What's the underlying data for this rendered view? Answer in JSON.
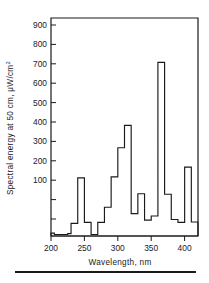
{
  "chart_data": {
    "type": "line",
    "title": "",
    "subtitle": "",
    "xlabel": "Wavelength, nm",
    "ylabel": "Spectral energy at 50 cm, μW/cm²",
    "xlim": [
      200,
      420
    ],
    "ylim": [
      0,
      950
    ],
    "xticks": [
      200,
      250,
      300,
      350,
      400
    ],
    "yticks": [
      100,
      200,
      300,
      400,
      500,
      600,
      700,
      800,
      900
    ],
    "grid": false,
    "legend": null,
    "style": "step",
    "x_bin_edges": [
      200,
      205,
      210,
      215,
      220,
      225,
      230,
      235,
      240,
      245,
      250,
      255,
      260,
      265,
      270,
      275,
      280,
      285,
      290,
      295,
      300,
      305,
      310,
      315,
      320,
      325,
      330,
      335,
      340,
      345,
      350,
      355,
      360,
      365,
      370,
      375,
      380,
      385,
      390,
      395,
      400,
      405,
      410,
      415,
      420
    ],
    "values": [
      15,
      8,
      8,
      8,
      8,
      12,
      65,
      65,
      300,
      300,
      70,
      70,
      8,
      8,
      70,
      70,
      148,
      148,
      305,
      305,
      455,
      455,
      570,
      570,
      115,
      115,
      218,
      218,
      82,
      82,
      103,
      103,
      895,
      895,
      215,
      215,
      85,
      85,
      70,
      70,
      355,
      355,
      72,
      72
    ],
    "annotations": []
  },
  "axis": {
    "y_tick_labels": [
      "900",
      "800",
      "700",
      "600",
      "500",
      "400",
      "300",
      "200",
      "100"
    ],
    "x_tick_labels": [
      "200",
      "250",
      "300",
      "350",
      "400"
    ],
    "x_axis_title": "Wavelength, nm",
    "y_axis_title_main": "Spectral energy at 50 cm, μW/cm",
    "y_axis_title_exponent": "2"
  },
  "colors": {
    "ink": "#1a1a1a",
    "background": "#ffffff"
  }
}
